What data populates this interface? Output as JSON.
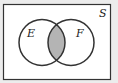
{
  "diagram": {
    "type": "venn",
    "universe_label": "S",
    "sets": [
      {
        "label": "E",
        "cx": 42,
        "cy": 42.5,
        "r": 23
      },
      {
        "label": "F",
        "cx": 71,
        "cy": 42.5,
        "r": 23
      }
    ],
    "shaded_region": "E ∩ F",
    "colors": {
      "background": "#ececec",
      "universe_fill": "#ffffff",
      "stroke": "#333333",
      "shade": "#b4b4b4"
    }
  }
}
